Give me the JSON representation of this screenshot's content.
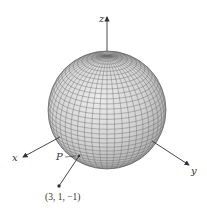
{
  "figure": {
    "type": "3D sphere with coordinate axes",
    "axes": {
      "x_label": "x",
      "y_label": "y",
      "z_label": "z"
    },
    "point_label": "P",
    "external_point_label": "(3, 1, −1)",
    "colors": {
      "sphere_fill": "#d4d4d4",
      "mesh_lines": "#6e6e6e",
      "axes": "#333333",
      "background": "#ffffff"
    }
  }
}
